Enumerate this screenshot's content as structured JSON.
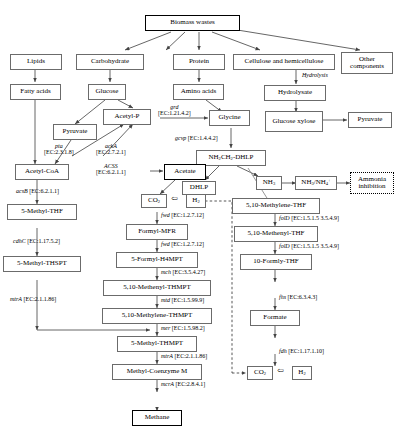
{
  "diagram": {
    "colors": {
      "node_border": "#6b6b6b",
      "node_border_bold": "#000000",
      "edge": "#6b6b6b",
      "background": "#ffffff"
    },
    "nodes": [
      {
        "id": "biomass",
        "label": "Biomass wastes"
      },
      {
        "id": "lipids",
        "label": "Lipids"
      },
      {
        "id": "carbohydrate",
        "label": "Carbohydrate"
      },
      {
        "id": "protein",
        "label": "Protein"
      },
      {
        "id": "cellulose",
        "label": "Cellulose and hemicellulose"
      },
      {
        "id": "other",
        "label": "Other components"
      },
      {
        "id": "fattyacids",
        "label": "Fatty acids"
      },
      {
        "id": "glucose",
        "label": "Glucose"
      },
      {
        "id": "aminoacids",
        "label": "Amino acids"
      },
      {
        "id": "hydrolysate",
        "label": "Hydrolysate"
      },
      {
        "id": "glucosexylose",
        "label": "Glucose xylose"
      },
      {
        "id": "pyruvate_r",
        "label": "Pyruvate"
      },
      {
        "id": "pyruvate",
        "label": "Pyruvate"
      },
      {
        "id": "acetylp",
        "label": "Acetyl-P"
      },
      {
        "id": "glycine",
        "label": "Glycine"
      },
      {
        "id": "nh2ch2dhlp",
        "label": "NH2CH2-DHLP"
      },
      {
        "id": "dhlp",
        "label": "DHLP"
      },
      {
        "id": "nh3",
        "label": "NH3"
      },
      {
        "id": "nh3nh4",
        "label": "NH3/NH4+"
      },
      {
        "id": "ammoniainh",
        "label": "Ammonia inhibition"
      },
      {
        "id": "acetylcoa",
        "label": "Acetyl-CoA"
      },
      {
        "id": "acetate",
        "label": "Acetate"
      },
      {
        "id": "methylthf",
        "label": "5-Methyl-THF"
      },
      {
        "id": "methylthspt",
        "label": "5-Methyl-THSPT"
      },
      {
        "id": "co2_mid",
        "label": "CO2"
      },
      {
        "id": "h2_mid",
        "label": "H2"
      },
      {
        "id": "formylmfr",
        "label": "Formyl-MFR"
      },
      {
        "id": "formylh4mpt",
        "label": "5-Formyl-H4MPT"
      },
      {
        "id": "methenylthmpt",
        "label": "5,10-Methenyl-THMPT"
      },
      {
        "id": "methylenethmpt",
        "label": "5,10-Methylene-THMPT"
      },
      {
        "id": "methylthmpt",
        "label": "5-Methyl-THMPT"
      },
      {
        "id": "methylcom",
        "label": "Methyl-Coenzyme M"
      },
      {
        "id": "methane",
        "label": "Methane"
      },
      {
        "id": "methylenethf",
        "label": "5,10-Methylene-THF"
      },
      {
        "id": "methenylthf",
        "label": "5,10-Methenyl-THF"
      },
      {
        "id": "formlythf",
        "label": "10-Formly-THF"
      },
      {
        "id": "formate",
        "label": "Formate"
      },
      {
        "id": "co2_bot",
        "label": "CO2"
      },
      {
        "id": "h2_bot",
        "label": "H2"
      }
    ],
    "edge_labels": [
      {
        "id": "hydrolysis",
        "gene": "Hydrolysis",
        "ec": ""
      },
      {
        "id": "grd",
        "gene": "grd",
        "ec": "[EC:1.21.4.2]"
      },
      {
        "id": "gcvp",
        "gene": "gcvp",
        "ec": "[EC:1.4.4.2]"
      },
      {
        "id": "pta",
        "gene": "pta",
        "ec": "[EC:2.3.1.8]"
      },
      {
        "id": "ackA",
        "gene": "ackA",
        "ec": "[EC:2.7.2.1]"
      },
      {
        "id": "ACSS",
        "gene": "ACSS",
        "ec": "[EC:6.2.1.1]"
      },
      {
        "id": "acsB",
        "gene": "acsB",
        "ec": "[EC:6.2.1.1]"
      },
      {
        "id": "cdhC",
        "gene": "cdhC",
        "ec": "[EC:1.17.5.2]"
      },
      {
        "id": "mtrA_left",
        "gene": "mtrA",
        "ec": "[EC:2.1.1.86]"
      },
      {
        "id": "fwd1",
        "gene": "fwd",
        "ec": "[EC:1.2.7.12]"
      },
      {
        "id": "fwd2",
        "gene": "fwd",
        "ec": "[EC:1.2.7.12]"
      },
      {
        "id": "mch",
        "gene": "mch",
        "ec": "[EC:3.5.4.27]"
      },
      {
        "id": "mtd",
        "gene": "mtd",
        "ec": "[EC:1.5.99.9]"
      },
      {
        "id": "mer",
        "gene": "mer",
        "ec": "[EC:1.5.98.2]"
      },
      {
        "id": "mtrA_mid",
        "gene": "mtrA",
        "ec": "[EC:2.1.1.86]"
      },
      {
        "id": "mcrA",
        "gene": "mcrA",
        "ec": "[EC:2.8.4.1]"
      },
      {
        "id": "folD1",
        "gene": "folD",
        "ec": "[EC:1.5.1.5 3.5.4.9]"
      },
      {
        "id": "folD2",
        "gene": "folD",
        "ec": "[EC:1.5.1.5 3.5.4.9]"
      },
      {
        "id": "fhs",
        "gene": "fhs",
        "ec": "[EC:6.3.4.3]"
      },
      {
        "id": "fdh",
        "gene": "fdh",
        "ec": "[EC:1.17.1.10]"
      }
    ]
  }
}
